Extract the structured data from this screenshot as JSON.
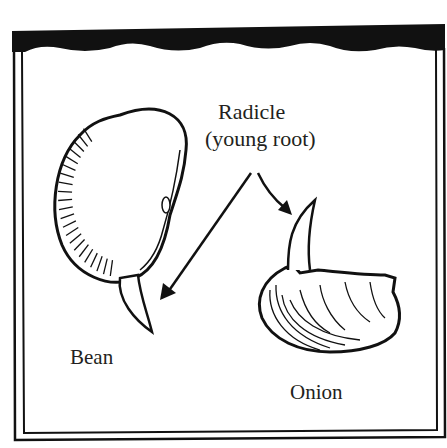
{
  "diagram": {
    "type": "labeled-illustration",
    "labels": {
      "radicle_line1": "Radicle",
      "radicle_line2": "(young root)",
      "bean": "Bean",
      "onion": "Onion"
    },
    "colors": {
      "ink": "#111111",
      "paper": "#ffffff",
      "text": "#231f20"
    }
  }
}
